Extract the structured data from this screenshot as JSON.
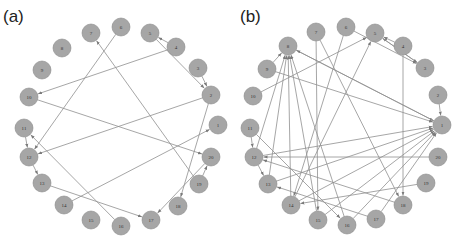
{
  "panels": [
    {
      "id": "a",
      "label": "(a)",
      "label_pos": [
        3,
        22
      ],
      "node_radius": 9,
      "nodes": [
        {
          "id": "1",
          "x": 218,
          "y": 125
        },
        {
          "id": "2",
          "x": 211,
          "y": 95
        },
        {
          "id": "3",
          "x": 198,
          "y": 68
        },
        {
          "id": "4",
          "x": 176,
          "y": 47
        },
        {
          "id": "5",
          "x": 150,
          "y": 33
        },
        {
          "id": "6",
          "x": 121,
          "y": 27
        },
        {
          "id": "7",
          "x": 91,
          "y": 33
        },
        {
          "id": "8",
          "x": 62,
          "y": 48
        },
        {
          "id": "9",
          "x": 42,
          "y": 70
        },
        {
          "id": "10",
          "x": 29,
          "y": 97
        },
        {
          "id": "11",
          "x": 24,
          "y": 128
        },
        {
          "id": "12",
          "x": 29,
          "y": 157
        },
        {
          "id": "13",
          "x": 42,
          "y": 183
        },
        {
          "id": "14",
          "x": 64,
          "y": 205
        },
        {
          "id": "15",
          "x": 91,
          "y": 220
        },
        {
          "id": "16",
          "x": 121,
          "y": 226
        },
        {
          "id": "17",
          "x": 151,
          "y": 220
        },
        {
          "id": "18",
          "x": 178,
          "y": 206
        },
        {
          "id": "19",
          "x": 199,
          "y": 184
        },
        {
          "id": "20",
          "x": 211,
          "y": 157
        }
      ],
      "edges": [
        {
          "from": "4",
          "to": "5"
        },
        {
          "from": "5",
          "to": "2"
        },
        {
          "from": "3",
          "to": "2"
        },
        {
          "from": "4",
          "to": "10"
        },
        {
          "from": "6",
          "to": "12"
        },
        {
          "from": "19",
          "to": "7"
        },
        {
          "from": "10",
          "to": "20"
        },
        {
          "from": "2",
          "to": "12"
        },
        {
          "from": "2",
          "to": "18"
        },
        {
          "from": "11",
          "to": "12"
        },
        {
          "from": "12",
          "to": "13"
        },
        {
          "from": "16",
          "to": "11"
        },
        {
          "from": "14",
          "to": "1"
        },
        {
          "from": "13",
          "to": "17"
        },
        {
          "from": "20",
          "to": "17"
        },
        {
          "from": "19",
          "to": "20"
        }
      ]
    },
    {
      "id": "b",
      "label": "(b)",
      "label_pos": [
        240,
        22
      ],
      "node_radius": 9,
      "nodes": [
        {
          "id": "1",
          "x": 442,
          "y": 125
        },
        {
          "id": "2",
          "x": 438,
          "y": 95
        },
        {
          "id": "3",
          "x": 425,
          "y": 68
        },
        {
          "id": "4",
          "x": 403,
          "y": 46
        },
        {
          "id": "5",
          "x": 375,
          "y": 33
        },
        {
          "id": "6",
          "x": 346,
          "y": 27
        },
        {
          "id": "7",
          "x": 316,
          "y": 32
        },
        {
          "id": "8",
          "x": 288,
          "y": 46
        },
        {
          "id": "9",
          "x": 267,
          "y": 69
        },
        {
          "id": "10",
          "x": 253,
          "y": 96
        },
        {
          "id": "11",
          "x": 250,
          "y": 128
        },
        {
          "id": "12",
          "x": 254,
          "y": 157
        },
        {
          "id": "13",
          "x": 268,
          "y": 184
        },
        {
          "id": "14",
          "x": 291,
          "y": 205
        },
        {
          "id": "15",
          "x": 318,
          "y": 220
        },
        {
          "id": "16",
          "x": 347,
          "y": 225
        },
        {
          "id": "17",
          "x": 376,
          "y": 219
        },
        {
          "id": "18",
          "x": 403,
          "y": 205
        },
        {
          "id": "19",
          "x": 426,
          "y": 183
        },
        {
          "id": "20",
          "x": 438,
          "y": 157
        }
      ],
      "edges": [
        {
          "from": "6",
          "to": "3"
        },
        {
          "from": "4",
          "to": "5"
        },
        {
          "from": "3",
          "to": "5"
        },
        {
          "from": "5",
          "to": "3"
        },
        {
          "from": "2",
          "to": "1"
        },
        {
          "from": "10",
          "to": "5"
        },
        {
          "from": "14",
          "to": "5"
        },
        {
          "from": "9",
          "to": "1"
        },
        {
          "from": "8",
          "to": "1"
        },
        {
          "from": "1",
          "to": "8"
        },
        {
          "from": "9",
          "to": "8"
        },
        {
          "from": "13",
          "to": "8"
        },
        {
          "from": "12",
          "to": "8"
        },
        {
          "from": "14",
          "to": "8"
        },
        {
          "from": "15",
          "to": "8"
        },
        {
          "from": "16",
          "to": "8"
        },
        {
          "from": "7",
          "to": "15"
        },
        {
          "from": "6",
          "to": "14"
        },
        {
          "from": "7",
          "to": "18"
        },
        {
          "from": "4",
          "to": "18"
        },
        {
          "from": "11",
          "to": "16"
        },
        {
          "from": "11",
          "to": "12"
        },
        {
          "from": "12",
          "to": "13"
        },
        {
          "from": "20",
          "to": "12"
        },
        {
          "from": "18",
          "to": "12"
        },
        {
          "from": "17",
          "to": "13"
        },
        {
          "from": "19",
          "to": "14"
        },
        {
          "from": "13",
          "to": "1"
        },
        {
          "from": "14",
          "to": "1"
        },
        {
          "from": "15",
          "to": "1"
        },
        {
          "from": "16",
          "to": "1"
        },
        {
          "from": "17",
          "to": "1"
        },
        {
          "from": "12",
          "to": "1"
        }
      ]
    }
  ]
}
